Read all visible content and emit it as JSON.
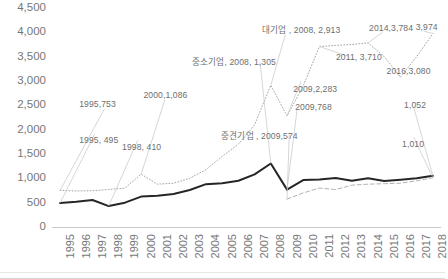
{
  "chart_data": {
    "type": "line",
    "title": "",
    "xlabel": "",
    "ylabel": "",
    "ylim": [
      0,
      4500
    ],
    "grid": false,
    "legend": "none (series labelled inline)",
    "categories": [
      "1995",
      "1996",
      "1997",
      "1998",
      "1999",
      "2000",
      "2001",
      "2002",
      "2003",
      "2004",
      "2005",
      "2006",
      "2007",
      "2008",
      "2009",
      "2010",
      "2011",
      "2012",
      "2013",
      "2014",
      "2015",
      "2016",
      "2017",
      "2018"
    ],
    "y_ticks": [
      "0",
      "500",
      "1,000",
      "1,500",
      "2,000",
      "2,500",
      "3,000",
      "3,500",
      "4,000",
      "4,500"
    ],
    "series": [
      {
        "name": "대기업",
        "style": "dotted",
        "color": "#a6a6a6",
        "values": [
          753,
          740,
          745,
          770,
          800,
          1086,
          880,
          900,
          1000,
          1180,
          1450,
          1700,
          2100,
          2913,
          2283,
          2900,
          3710,
          3730,
          3750,
          3784,
          3500,
          3080,
          3500,
          3974
        ]
      },
      {
        "name": "중소기업",
        "style": "solid",
        "color": "#262626",
        "values": [
          495,
          520,
          555,
          430,
          500,
          625,
          640,
          680,
          760,
          880,
          900,
          950,
          1080,
          1305,
          768,
          965,
          975,
          1005,
          950,
          1000,
          945,
          970,
          1000,
          1052
        ]
      },
      {
        "name": "중견기업",
        "style": "dashed",
        "color": "#b3b3b3",
        "values": [
          null,
          null,
          null,
          null,
          null,
          null,
          null,
          null,
          null,
          null,
          null,
          null,
          null,
          null,
          574,
          700,
          800,
          770,
          860,
          880,
          890,
          900,
          950,
          1010
        ]
      }
    ],
    "annotations": [
      {
        "id": "a-1995-753",
        "text": "1995,753",
        "x_pct": 7.0,
        "y_pct": 42.0
      },
      {
        "id": "a-2000-1086",
        "text": "2000,1,086",
        "x_pct": 23.5,
        "y_pct": 38.0
      },
      {
        "id": "a-sme-2008",
        "text": "중소기업, 2008, 1,305",
        "x_pct": 36.0,
        "y_pct": 23.0
      },
      {
        "id": "a-large-2008",
        "text": "대기업 , 2008, 2,913",
        "x_pct": 54.0,
        "y_pct": 8.0
      },
      {
        "id": "a-2011-3710",
        "text": "2011, 3,710",
        "x_pct": 73.0,
        "y_pct": 20.5
      },
      {
        "id": "a-2014-3784",
        "text": "2014,3,784",
        "x_pct": 81.5,
        "y_pct": 7.5
      },
      {
        "id": "a-3974",
        "text": "3,974",
        "x_pct": 93.5,
        "y_pct": 7.0
      },
      {
        "id": "a-2016-3080",
        "text": "2016,3,080",
        "x_pct": 86.0,
        "y_pct": 27.0
      },
      {
        "id": "a-2009-2283",
        "text": "2009,2,283",
        "x_pct": 62.0,
        "y_pct": 35.0
      },
      {
        "id": "a-2009-768",
        "text": "2009,768",
        "x_pct": 62.5,
        "y_pct": 43.5
      },
      {
        "id": "a-mid-2009",
        "text": "중견기업 , 2009,574",
        "x_pct": 43.5,
        "y_pct": 56.5
      },
      {
        "id": "a-1052",
        "text": "1,052",
        "x_pct": 90.5,
        "y_pct": 42.5
      },
      {
        "id": "a-1010",
        "text": "1,010",
        "x_pct": 90.0,
        "y_pct": 60.5
      },
      {
        "id": "a-1995-495",
        "text": "1995, 495",
        "x_pct": 7.0,
        "y_pct": 58.5
      },
      {
        "id": "a-1998-410",
        "text": "1998, 410",
        "x_pct": 18.0,
        "y_pct": 61.5
      }
    ]
  },
  "colors": {
    "large_enterprise": "#a6a6a6",
    "small_enterprise": "#262626",
    "mid_enterprise": "#b3b3b3",
    "axis": "#c9c9c9",
    "text": "#6e6e6e"
  }
}
